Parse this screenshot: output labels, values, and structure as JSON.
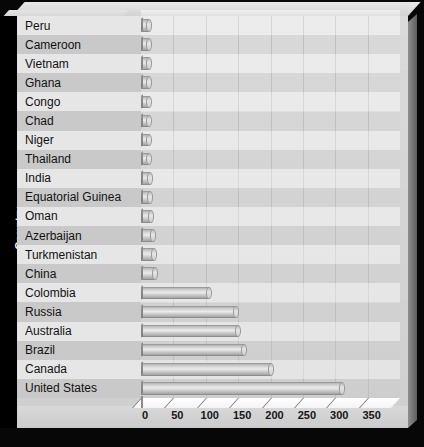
{
  "chart": {
    "type": "bar",
    "orientation": "horizontal",
    "ylabel": "Country",
    "xlabel": "",
    "title": ""
  },
  "axis": {
    "ticks": [
      0,
      50,
      100,
      150,
      200,
      250,
      300,
      350
    ],
    "xlim": [
      0,
      350
    ],
    "grid": true
  },
  "chart_data": {
    "type": "bar",
    "title": "",
    "xlabel": "",
    "ylabel": "Country",
    "orientation": "horizontal",
    "xlim": [
      0,
      350
    ],
    "grid": true,
    "legend": false,
    "tick_labels": [
      "0",
      "50",
      "100",
      "150",
      "200",
      "250",
      "300",
      "350"
    ],
    "categories": [
      "Peru",
      "Cameroon",
      "Vietnam",
      "Ghana",
      "Congo",
      "Chad",
      "Niger",
      "Thailand",
      "India",
      "Equatorial Guinea",
      "Oman",
      "Azerbaijan",
      "Turkmenistan",
      "China",
      "Colombia",
      "Russia",
      "Australia",
      "Brazil",
      "Canada",
      "United States"
    ],
    "values": [
      6,
      6,
      7,
      7,
      8,
      9,
      10,
      12,
      14,
      14,
      16,
      19,
      20,
      22,
      105,
      146,
      150,
      159,
      200,
      310
    ]
  }
}
